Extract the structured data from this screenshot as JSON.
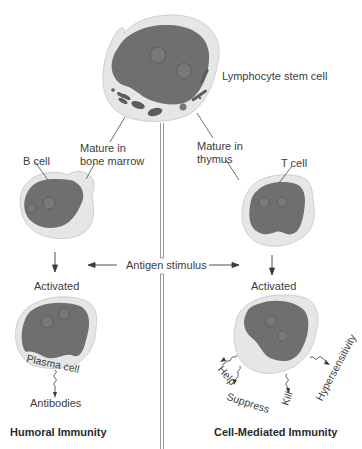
{
  "diagram": {
    "title_top": "Lymphocyte stem cell",
    "left_branch": {
      "mature_label_line1": "Mature in",
      "mature_label_line2": "bone marrow",
      "cell_label": "B cell",
      "activated_label": "Activated",
      "activated_cell_label": "Plasma cell",
      "output_label": "Antibodies",
      "section_title": "Humoral Immunity"
    },
    "right_branch": {
      "mature_label_line1": "Mature in",
      "mature_label_line2": "thymus",
      "cell_label": "T cell",
      "activated_label": "Activated",
      "functions": [
        "Help",
        "Suppress",
        "Kill",
        "Hypersensitivity"
      ],
      "section_title": "Cell-Mediated Immunity"
    },
    "center_label": "Antigen stimulus",
    "colors": {
      "nucleus": "#6e6e6e",
      "nucleolus": "#7a7a7a",
      "cytoplasm": "#e4e4e4",
      "cell_outline": "#d0d0d0",
      "organelle": "#5a5a5a",
      "line": "#444444",
      "divider": "#888888",
      "text": "#3c3c3c"
    }
  }
}
